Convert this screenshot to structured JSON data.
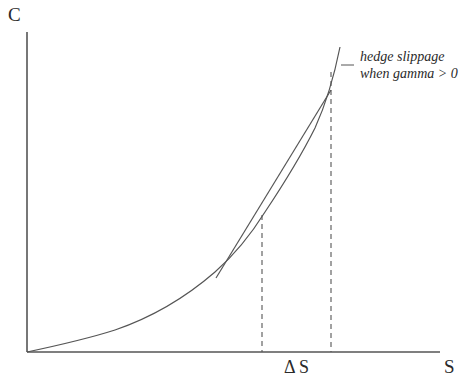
{
  "diagram": {
    "y_axis_label": "C",
    "x_axis_label": "S",
    "delta_label": "Δ S",
    "annotation": {
      "line1": "hedge slippage",
      "line2": "when gamma > 0"
    },
    "elements": [
      {
        "id": "y-axis",
        "type": "axis"
      },
      {
        "id": "x-axis",
        "type": "axis"
      },
      {
        "id": "option-value-curve",
        "type": "convex-curve",
        "description": "option value C as function of S"
      },
      {
        "id": "delta-tangent-line",
        "type": "tangent",
        "description": "tangent (delta hedge) at the point"
      },
      {
        "id": "dashed-line-tangent-point",
        "type": "dashed-vertical"
      },
      {
        "id": "dashed-line-shifted-point",
        "type": "dashed-vertical"
      }
    ]
  },
  "colors": {
    "stroke": "#555555",
    "text": "#2a2a2a",
    "background": "#ffffff"
  }
}
